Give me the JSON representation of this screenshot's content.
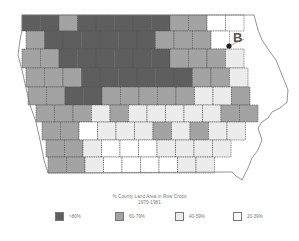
{
  "title": {
    "line1": "% County Land Area in Row Crops",
    "line2": "1979-1981"
  },
  "marker": {
    "label": "B"
  },
  "colors": {
    "gt80": "#5e5e5e",
    "60_79": "#a3a3a3",
    "40_59": "#ececec",
    "20_39": "#ffffff"
  },
  "legend": [
    {
      "label": ">80%",
      "class": "gt80"
    },
    {
      "label": "60-79%",
      "class": "60_79"
    },
    {
      "label": "40-59%",
      "class": "40_59"
    },
    {
      "label": "20-39%",
      "class": "20_39"
    }
  ],
  "grid": {
    "x0": 22,
    "col_w": 18.5,
    "rows": [
      {
        "y": 15,
        "h": 16,
        "x_start": 22,
        "cells": [
          "gt80",
          "gt80",
          "60_79",
          "gt80",
          "gt80",
          "gt80",
          "gt80",
          "gt80",
          "60_79",
          "60_79",
          "20_39",
          "20_39"
        ]
      },
      {
        "y": 31,
        "h": 18,
        "x_start": 26,
        "cells": [
          "60_79",
          "gt80",
          "gt80",
          "gt80",
          "gt80",
          "gt80",
          "gt80",
          "60_79",
          "60_79",
          "60_79",
          "20_39"
        ]
      },
      {
        "y": 49,
        "h": 19,
        "x_start": 22,
        "cells": [
          "60_79",
          "60_79",
          "gt80",
          "gt80",
          "gt80",
          "gt80",
          "gt80",
          "gt80",
          "60_79",
          "60_79",
          "60_79",
          "40_59"
        ]
      },
      {
        "y": 68,
        "h": 19,
        "x_start": 26,
        "cells": [
          "60_79",
          "60_79",
          "60_79",
          "gt80",
          "gt80",
          "gt80",
          "gt80",
          "gt80",
          "gt80",
          "60_79",
          "60_79",
          "40_59"
        ]
      },
      {
        "y": 87,
        "h": 18,
        "x_start": 28,
        "cells": [
          "60_79",
          "60_79",
          "gt80",
          "gt80",
          "60_79",
          "60_79",
          "60_79",
          "60_79",
          "60_79",
          "40_59",
          "40_59",
          "60_79"
        ]
      },
      {
        "y": 105,
        "h": 17,
        "x_start": 36,
        "cells": [
          "60_79",
          "60_79",
          "60_79",
          "40_59",
          "60_79",
          "40_59",
          "40_59",
          "40_59",
          "40_59",
          "40_59",
          "60_79",
          "60_79"
        ]
      },
      {
        "y": 122,
        "h": 18,
        "x_start": 42,
        "cells": [
          "60_79",
          "60_79",
          "20_39",
          "40_59",
          "40_59",
          "40_59",
          "60_79",
          "40_59",
          "60_79",
          "40_59",
          "40_59"
        ]
      },
      {
        "y": 140,
        "h": 17,
        "x_start": 46,
        "cells": [
          "60_79",
          "60_79",
          "40_59",
          "20_39",
          "20_39",
          "20_39",
          "40_59",
          "40_59",
          "40_59",
          "40_59"
        ]
      },
      {
        "y": 157,
        "h": 16,
        "x_start": 48,
        "cells": [
          "60_79",
          "60_79",
          "40_59",
          "20_39",
          "20_39",
          "20_39",
          "20_39",
          "40_59",
          "40_59"
        ]
      }
    ]
  }
}
